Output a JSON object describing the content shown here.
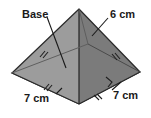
{
  "figure": {
    "name": "square-pyramid-diagram",
    "colors": {
      "base_face": "#b4b4b4",
      "left_face": "#9a9a9a",
      "right_face": "#7d7d7d",
      "back_face": "#c2c2c2",
      "outline": "#2b2b2b",
      "hidden_line": "#6e6e6e",
      "text": "#1a1a1a",
      "background": "#ffffff"
    },
    "labels": {
      "base": "Base",
      "slant_edge": "6 cm",
      "base_edge_left": "7 cm",
      "base_edge_right": "7 cm"
    },
    "marks": {
      "tick_count": 2,
      "right_angle": "right-angle-marker"
    }
  }
}
